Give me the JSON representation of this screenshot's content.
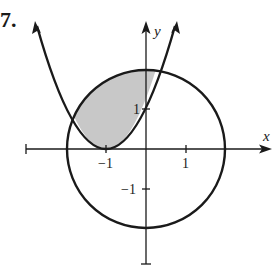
{
  "problem": {
    "number": "7."
  },
  "axes": {
    "x_label": "x",
    "y_label": "y",
    "x_ticks": [
      {
        "value": -1,
        "label": "−1"
      },
      {
        "value": 1,
        "label": "1"
      }
    ],
    "y_ticks": [
      {
        "value": 1,
        "label": "1"
      },
      {
        "value": -1,
        "label": "−1"
      }
    ]
  },
  "curves": [
    {
      "name": "circle",
      "equation": "x^2 + y^2 = 4",
      "center": [
        0,
        0
      ],
      "radius": 2
    },
    {
      "name": "parabola",
      "equation": "y = (x+1)^2",
      "vertex": [
        -1,
        0
      ]
    }
  ],
  "shaded_region": {
    "description": "Region inside the circle and above the parabola",
    "fill_color": "#c8c8c8"
  },
  "colors": {
    "stroke": "#1a1a1a",
    "background": "#ffffff",
    "shade": "#c8c8c8"
  }
}
